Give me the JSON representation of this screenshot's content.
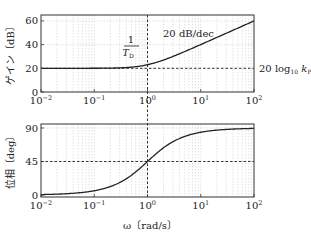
{
  "chart_data": [
    {
      "type": "line",
      "title": "",
      "xlabel": "ω〔rad/s〕",
      "ylabel": "ゲイン〔dB〕",
      "xscale": "log",
      "xlim": [
        0.01,
        100
      ],
      "ylim": [
        0,
        65
      ],
      "xticks": [
        "10^-2",
        "10^-1",
        "10^0",
        "10^1",
        "10^2"
      ],
      "yticks": [
        0,
        20,
        40,
        60
      ],
      "grid": true,
      "series": [
        {
          "name": "gain",
          "x": [
            0.01,
            0.03,
            0.1,
            0.3,
            0.5,
            1,
            2,
            3,
            5,
            10,
            20,
            50,
            100
          ],
          "values": [
            20.0,
            20.0,
            20.04,
            20.37,
            20.97,
            23.01,
            26.99,
            30.0,
            34.15,
            40.04,
            46.03,
            53.98,
            60.0
          ]
        }
      ],
      "annotations": [
        {
          "text": "1/T_D",
          "x": 1,
          "note": "corner frequency, vertical dashed line"
        },
        {
          "text": "20 dB/dec",
          "note": "asymptotic slope above corner"
        },
        {
          "text": "20 log10 kP",
          "y": 20,
          "note": "horizontal dashed line"
        }
      ]
    },
    {
      "type": "line",
      "title": "",
      "xlabel": "ω〔rad/s〕",
      "ylabel": "位相〔deg〕",
      "xscale": "log",
      "xlim": [
        0.01,
        100
      ],
      "ylim": [
        0,
        95
      ],
      "xticks": [
        "10^-2",
        "10^-1",
        "10^0",
        "10^1",
        "10^2"
      ],
      "yticks": [
        0,
        45,
        90
      ],
      "grid": true,
      "series": [
        {
          "name": "phase",
          "x": [
            0.01,
            0.03,
            0.1,
            0.3,
            0.5,
            1,
            2,
            3,
            5,
            10,
            20,
            50,
            100
          ],
          "values": [
            0.57,
            1.72,
            5.71,
            16.7,
            26.57,
            45.0,
            63.43,
            71.57,
            78.69,
            84.29,
            87.14,
            88.85,
            89.43
          ]
        }
      ],
      "annotations": [
        {
          "text": "45",
          "y": 45,
          "note": "horizontal dashed line at 45 deg"
        }
      ]
    }
  ],
  "labels": {
    "gain_ylabel": "ゲイン〔dB〕",
    "phase_ylabel": "位相〔deg〕",
    "xlabel": "ω〔rad/s〕",
    "corner_num": "1",
    "corner_den": "T",
    "corner_den_sub": "D",
    "slope": "20 dB/dec",
    "kp_prefix": "20 log",
    "kp_sub": "10",
    "kp_var": "k",
    "kp_var_sub": "P"
  },
  "ticks": {
    "gain_y": [
      "0",
      "20",
      "40",
      "60"
    ],
    "phase_y": [
      "0",
      "45",
      "90"
    ],
    "x_base": "10",
    "x_exp": [
      "−2",
      "−1",
      "0",
      "1",
      "2"
    ]
  }
}
